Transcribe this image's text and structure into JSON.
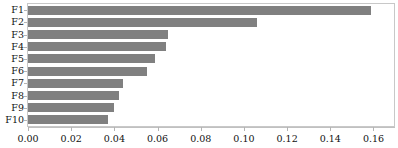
{
  "chart_data": {
    "type": "bar",
    "orientation": "horizontal",
    "title": "",
    "subtitle": "",
    "xlabel": "",
    "ylabel": "",
    "categories": [
      "F1",
      "F2",
      "F3",
      "F4",
      "F5",
      "F6",
      "F7",
      "F8",
      "F9",
      "F10"
    ],
    "values": [
      0.159,
      0.106,
      0.065,
      0.064,
      0.059,
      0.055,
      0.044,
      0.042,
      0.04,
      0.037
    ],
    "series": [
      {
        "name": "importance",
        "values": [
          0.159,
          0.106,
          0.065,
          0.064,
          0.059,
          0.055,
          0.044,
          0.042,
          0.04,
          0.037
        ]
      }
    ],
    "xlim": [
      0.0,
      0.1695
    ],
    "xticks": [
      0.0,
      0.02,
      0.04,
      0.06,
      0.08,
      0.1,
      0.12,
      0.14,
      0.16
    ],
    "xticklabels": [
      "0.00",
      "0.02",
      "0.04",
      "0.06",
      "0.08",
      "0.10",
      "0.12",
      "0.14",
      "0.16"
    ],
    "yticklabels": [
      "F1",
      "F2",
      "F3",
      "F4",
      "F5",
      "F6",
      "F7",
      "F8",
      "F9",
      "F10"
    ],
    "grid": false,
    "legend": null,
    "legend_position": "none",
    "bar_color": "#808080",
    "frame_color": "#c8c8c8",
    "axis_color": "#b4b4b4",
    "text_color": "#111111",
    "background": "#ffffff"
  }
}
